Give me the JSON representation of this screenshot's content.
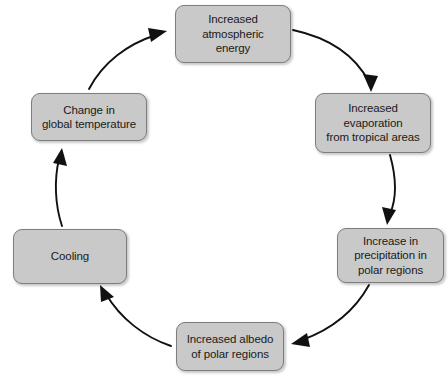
{
  "diagram": {
    "type": "cycle",
    "background_color": "#ffffff",
    "node_fill_color": "#c9c9c9",
    "node_border_color": "#7d7d7d",
    "arrow_color": "#111111",
    "text_color": "#1a1a1a",
    "flow_direction": "clockwise",
    "nodes": [
      {
        "id": "atmospheric-energy",
        "label": "Increased\natmospheric\nenergy",
        "position": "top"
      },
      {
        "id": "evaporation",
        "label": "Increased\nevaporation\nfrom tropical areas",
        "position": "upper-right"
      },
      {
        "id": "precipitation",
        "label": "Increase in\nprecipitation in\npolar regions",
        "position": "lower-right"
      },
      {
        "id": "albedo",
        "label": "Increased albedo\nof polar regions",
        "position": "bottom"
      },
      {
        "id": "cooling",
        "label": "Cooling",
        "position": "lower-left"
      },
      {
        "id": "global-temperature",
        "label": "Change in\nglobal temperature",
        "position": "upper-left"
      }
    ],
    "edges": [
      {
        "id": "edge-1",
        "from": "atmospheric-energy",
        "to": "evaporation"
      },
      {
        "id": "edge-2",
        "from": "evaporation",
        "to": "precipitation"
      },
      {
        "id": "edge-3",
        "from": "precipitation",
        "to": "albedo"
      },
      {
        "id": "edge-4",
        "from": "albedo",
        "to": "cooling"
      },
      {
        "id": "edge-5",
        "from": "cooling",
        "to": "global-temperature"
      },
      {
        "id": "edge-6",
        "from": "global-temperature",
        "to": "atmospheric-energy"
      }
    ]
  }
}
